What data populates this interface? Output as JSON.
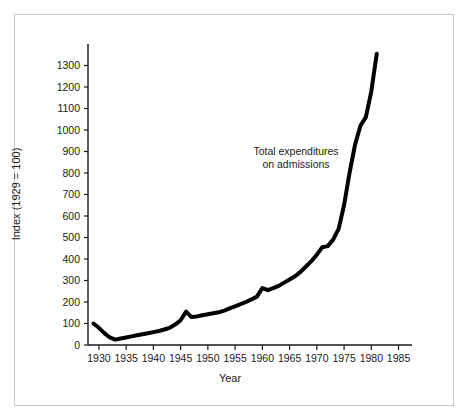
{
  "figure": {
    "background_color": "#ffffff",
    "frame_color": "#c8c8c8",
    "line_color": "#000000",
    "text_color": "#1a1a1a"
  },
  "annotation": {
    "line1": "Total expenditures",
    "line2": "on admissions"
  },
  "chart_data": {
    "type": "line",
    "title": "",
    "xlabel": "Year",
    "ylabel": "Index (1929 = 100)",
    "xlim": [
      1928,
      1986
    ],
    "ylim": [
      0,
      1400
    ],
    "xticks": [
      1930,
      1935,
      1940,
      1945,
      1950,
      1955,
      1960,
      1965,
      1970,
      1975,
      1980,
      1985
    ],
    "xtick_labels": [
      "1930",
      "1935",
      "1940",
      "1945",
      "1950",
      "1955",
      "1960",
      "1965",
      "1970",
      "1975",
      "1980",
      "1985"
    ],
    "yticks": [
      0,
      100,
      200,
      300,
      400,
      500,
      600,
      700,
      800,
      900,
      1000,
      1100,
      1200,
      1300
    ],
    "ytick_labels": [
      "0",
      "100",
      "200",
      "300",
      "400",
      "500",
      "600",
      "700",
      "800",
      "900",
      "1000",
      "1100",
      "1200",
      "1300"
    ],
    "grid": false,
    "legend": "none",
    "annotations": [
      {
        "text": "Total expenditures on admissions",
        "x": 1968,
        "y": 880
      }
    ],
    "series": [
      {
        "name": "Total expenditures on admissions",
        "color": "#000000",
        "linewidth": 4,
        "x": [
          1929,
          1930,
          1931,
          1932,
          1933,
          1934,
          1935,
          1936,
          1937,
          1938,
          1939,
          1940,
          1941,
          1942,
          1943,
          1944,
          1945,
          1946,
          1947,
          1948,
          1949,
          1950,
          1951,
          1952,
          1953,
          1954,
          1955,
          1956,
          1957,
          1958,
          1959,
          1960,
          1961,
          1962,
          1963,
          1964,
          1965,
          1966,
          1967,
          1968,
          1969,
          1970,
          1971,
          1972,
          1973,
          1974,
          1975,
          1976,
          1977,
          1978,
          1979,
          1980,
          1981
        ],
        "y": [
          100,
          80,
          55,
          35,
          25,
          30,
          35,
          40,
          45,
          50,
          55,
          60,
          65,
          72,
          80,
          95,
          115,
          155,
          130,
          133,
          138,
          143,
          148,
          152,
          160,
          170,
          180,
          190,
          200,
          212,
          225,
          265,
          255,
          265,
          275,
          290,
          305,
          320,
          340,
          365,
          390,
          420,
          455,
          460,
          490,
          540,
          650,
          800,
          930,
          1020,
          1060,
          1180,
          1355
        ]
      }
    ]
  }
}
